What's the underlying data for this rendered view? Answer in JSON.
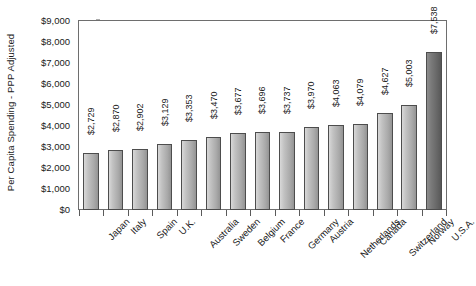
{
  "chart_data": {
    "type": "bar",
    "title": "",
    "xlabel": "",
    "ylabel": "Per Capita Spending - PPP Adjusted",
    "ylim": [
      0,
      9000
    ],
    "grid": false,
    "legend": "none",
    "categories": [
      "Japan",
      "Italy",
      "Spain",
      "U.K.",
      "Australia",
      "Sweden",
      "Belgium",
      "France",
      "Germany",
      "Austria",
      "Netherlands",
      "Canada",
      "Switzerland",
      "Norway",
      "U.S.A."
    ],
    "values": [
      2729,
      2870,
      2902,
      3129,
      3353,
      3470,
      3677,
      3696,
      3737,
      3970,
      4063,
      4079,
      4627,
      5003,
      7538
    ],
    "value_labels": [
      "$2,729",
      "$2,870",
      "$2,902",
      "$3,129",
      "$3,353",
      "$3,470",
      "$3,677",
      "$3,696",
      "$3,737",
      "$3,970",
      "$4,063",
      "$4,079",
      "$4,627",
      "$5,003",
      "$7,538"
    ],
    "highlight_index": 14,
    "ytick_values": [
      0,
      1000,
      2000,
      3000,
      4000,
      5000,
      6000,
      7000,
      8000,
      9000
    ],
    "ytick_labels": [
      "$0",
      "$1,000",
      "$2,000",
      "$3,000",
      "$4,000",
      "$5,000",
      "$6,000",
      "$7,000",
      "$8,000",
      "$9,000"
    ],
    "colors": {
      "bar_fill_light": "#d8d8d8",
      "bar_fill_dark": "#949494",
      "bar_highlight_light": "#8d8d8d",
      "bar_highlight_dark": "#585858",
      "bar_outline": "#4d4d4d",
      "axis": "#6e6e6e",
      "text": "#1a1a1a",
      "background": "#ffffff"
    }
  }
}
